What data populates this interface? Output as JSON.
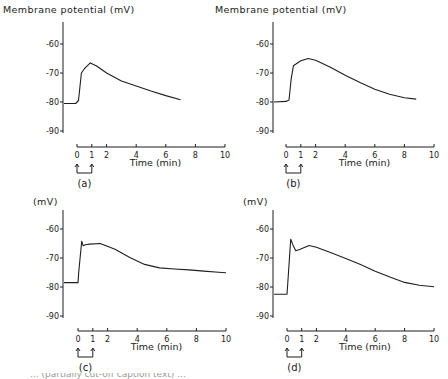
{
  "figure": {
    "footer_text": "... (partially cut-off caption text) ..."
  },
  "chart_data": [
    {
      "type": "line",
      "panel": "(a)",
      "ylabel": "Membrane potential (mV)",
      "xlabel": "Time (min)",
      "yticks": [
        -60,
        -70,
        -80,
        -90
      ],
      "xticks": [
        0,
        1,
        2,
        4,
        6,
        8,
        10
      ],
      "xlim": [
        0,
        10
      ],
      "ylim": [
        -90,
        -60
      ],
      "stimulus": {
        "start": 0,
        "end": 1
      },
      "x": [
        -1.0,
        -0.1,
        0.1,
        0.3,
        0.5,
        0.9,
        1.3,
        2.0,
        3.0,
        4.0,
        5.0,
        6.0,
        7.0
      ],
      "y": [
        -80.5,
        -80.5,
        -79.5,
        -70.0,
        -68.5,
        -66.5,
        -67.5,
        -70.0,
        -72.8,
        -74.5,
        -76.2,
        -77.8,
        -79.2
      ],
      "layout": {
        "ox": 63,
        "x0": 77,
        "x10": 225,
        "axis_y": 147,
        "y_m60": 44,
        "y_m90": 131,
        "axis_top": 22
      }
    },
    {
      "type": "line",
      "panel": "(b)",
      "ylabel": "Membrane potential (mV)",
      "xlabel": "Time (min)",
      "yticks": [
        -60,
        -70,
        -80,
        -90
      ],
      "xticks": [
        0,
        1,
        2,
        4,
        6,
        8,
        10
      ],
      "xlim": [
        0,
        10
      ],
      "ylim": [
        -90,
        -60
      ],
      "stimulus": {
        "start": 0,
        "end": 1
      },
      "x": [
        -1.0,
        0.0,
        0.2,
        0.35,
        0.5,
        1.0,
        1.5,
        2.0,
        3.0,
        4.0,
        5.0,
        6.0,
        7.0,
        8.0,
        8.8
      ],
      "y": [
        -80.0,
        -79.8,
        -79.3,
        -72.0,
        -67.5,
        -65.8,
        -65.0,
        -65.6,
        -68.0,
        -70.8,
        -73.3,
        -75.6,
        -77.3,
        -78.5,
        -79.0
      ],
      "layout": {
        "ox": 273,
        "x0": 286,
        "x10": 434,
        "axis_y": 147,
        "y_m60": 44,
        "y_m90": 131,
        "axis_top": 22
      }
    },
    {
      "type": "line",
      "panel": "(c)",
      "ylabel": "(mV)",
      "xlabel": "Time (min)",
      "yticks": [
        -60,
        -70,
        -80,
        -90
      ],
      "xticks": [
        0,
        1,
        2,
        4,
        6,
        8,
        10
      ],
      "xlim": [
        0,
        10
      ],
      "ylim": [
        -90,
        -60
      ],
      "stimulus": {
        "start": 0,
        "end": 1
      },
      "x": [
        -1.0,
        0.0,
        0.05,
        0.25,
        0.35,
        0.5,
        0.8,
        1.5,
        2.5,
        3.5,
        4.5,
        5.5,
        6.5,
        7.5,
        8.5,
        9.5,
        10.0
      ],
      "y": [
        -78.5,
        -78.5,
        -75.0,
        -64.2,
        -65.8,
        -65.4,
        -65.2,
        -65.0,
        -67.0,
        -69.8,
        -72.2,
        -73.4,
        -73.8,
        -74.1,
        -74.5,
        -74.9,
        -75.1
      ],
      "layout": {
        "ox": 63,
        "x0": 78,
        "x10": 226,
        "axis_y": 331,
        "y_m60": 229,
        "y_m90": 316,
        "axis_top": 210
      }
    },
    {
      "type": "line",
      "panel": "(d)",
      "ylabel": "(mV)",
      "xlabel": "Time (min)",
      "yticks": [
        -60,
        -70,
        -80,
        -90
      ],
      "xticks": [
        0,
        1,
        2,
        4,
        6,
        8,
        10
      ],
      "xlim": [
        0,
        10
      ],
      "ylim": [
        -90,
        -60
      ],
      "stimulus": {
        "start": 0,
        "end": 1
      },
      "x": [
        -1.0,
        0.0,
        0.1,
        0.25,
        0.4,
        0.6,
        0.9,
        1.5,
        2.0,
        3.0,
        4.0,
        5.0,
        6.0,
        7.0,
        8.0,
        9.0,
        10.0
      ],
      "y": [
        -82.5,
        -82.5,
        -75.0,
        -63.5,
        -65.5,
        -67.5,
        -67.0,
        -65.7,
        -66.3,
        -68.2,
        -70.2,
        -72.2,
        -74.6,
        -76.6,
        -78.4,
        -79.4,
        -79.9
      ],
      "layout": {
        "ox": 273,
        "x0": 287,
        "x10": 434,
        "axis_y": 331,
        "y_m60": 229,
        "y_m90": 316,
        "axis_top": 210
      }
    }
  ]
}
